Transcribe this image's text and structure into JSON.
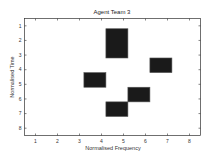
{
  "chart_data": {
    "type": "heatmap",
    "title": "Agent Team 3",
    "xlabel": "Normalised Frequency",
    "ylabel": "Normalised Time",
    "xlim": [
      0.5,
      8.5
    ],
    "ylim": [
      0.5,
      8.5
    ],
    "y_reversed": true,
    "xticks": [
      1,
      2,
      3,
      4,
      5,
      6,
      7,
      8
    ],
    "yticks": [
      1,
      2,
      3,
      4,
      5,
      6,
      7,
      8
    ],
    "grid": false,
    "legend": null,
    "fill_color": "#1a1a1a",
    "edge_color": "#555555",
    "blocks": [
      {
        "freq_start": 4.2,
        "freq_end": 5.2,
        "time_start": 1.2,
        "time_end": 3.2
      },
      {
        "freq_start": 6.2,
        "freq_end": 7.2,
        "time_start": 3.2,
        "time_end": 4.2
      },
      {
        "freq_start": 3.2,
        "freq_end": 4.2,
        "time_start": 4.2,
        "time_end": 5.2
      },
      {
        "freq_start": 5.2,
        "freq_end": 6.2,
        "time_start": 5.2,
        "time_end": 6.2
      },
      {
        "freq_start": 4.2,
        "freq_end": 5.2,
        "time_start": 6.2,
        "time_end": 7.2
      }
    ]
  }
}
